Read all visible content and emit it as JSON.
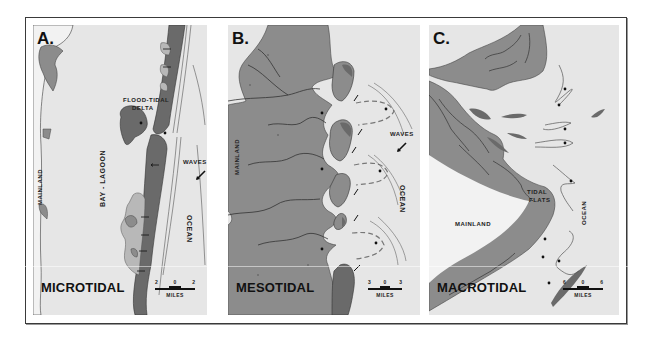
{
  "figure": {
    "colors": {
      "background": "#e6e6e6",
      "land": "#8c8c8c",
      "barrier": "#6a6a6a",
      "marsh": "#b8b8b8",
      "line": "#555555"
    }
  },
  "panels": [
    {
      "letter": "A.",
      "regime": "MICROTIDAL",
      "labels": {
        "flood_tidal_delta_1": "FLOOD-TIDAL",
        "flood_tidal_delta_2": "DELTA",
        "mainland": "MAINLAND",
        "bay_lagoon": "BAY - LAGOON",
        "waves": "WAVES",
        "ocean": "OCEAN"
      },
      "scale": {
        "left": "2",
        "mid": "0",
        "right": "2",
        "unit": "MILES"
      }
    },
    {
      "letter": "B.",
      "regime": "MESOTIDAL",
      "labels": {
        "mainland": "MAINLAND",
        "waves": "WAVES",
        "ocean": "OCEAN"
      },
      "scale": {
        "left": "3",
        "mid": "0",
        "right": "3",
        "unit": "MILES"
      }
    },
    {
      "letter": "C.",
      "regime": "MACROTIDAL",
      "labels": {
        "tidal_flats_1": "TIDAL",
        "tidal_flats_2": "FLATS",
        "mainland": "MAINLAND",
        "ocean": "OCEAN"
      },
      "scale": {
        "left": "6",
        "mid": "0",
        "right": "6",
        "unit": "MILES"
      }
    }
  ]
}
